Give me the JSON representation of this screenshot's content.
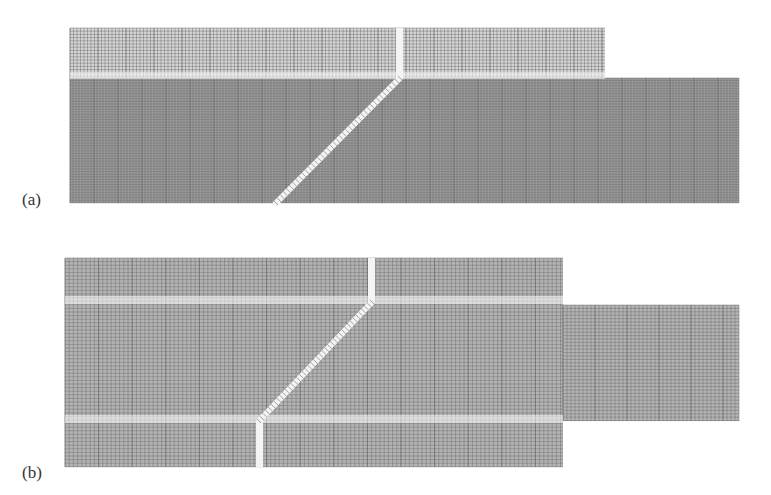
{
  "figure": {
    "panels": [
      {
        "id": "a",
        "label": "(a)",
        "label_pos": {
          "x": 22,
          "y": 190
        },
        "description": "Structured mesh with fine grid in lower region and inclined gap",
        "blocks": [
          {
            "name": "upper-block",
            "x": 70,
            "y": 28,
            "w": 535,
            "h": 50,
            "dx": 3.5,
            "dy": 3.2,
            "shade": "light"
          },
          {
            "name": "lower-main-block",
            "x": 70,
            "y": 78,
            "w": 669,
            "h": 125,
            "dx": 3.0,
            "dy": 2.6,
            "shade": "dark"
          }
        ],
        "vertical_gap": {
          "x": 396,
          "y1": 28,
          "y2": 78,
          "w": 7
        },
        "horizontal_band": {
          "y": 72,
          "h": 7
        },
        "diagonal_gap": {
          "x1": 400,
          "y1": 78,
          "x2": 276,
          "y2": 203,
          "w": 6
        }
      },
      {
        "id": "b",
        "label": "(b)",
        "label_pos": {
          "x": 22,
          "y": 463
        },
        "description": "Coarser structured mesh with bounded inclined gap and outlet channel",
        "blocks": [
          {
            "name": "main-block",
            "x": 65,
            "y": 258,
            "w": 498,
            "h": 209,
            "dx": 4.2,
            "dy": 3.6,
            "shade": "medium"
          },
          {
            "name": "outlet-block",
            "x": 563,
            "y": 305,
            "w": 176,
            "h": 116,
            "dx": 4.0,
            "dy": 3.4,
            "shade": "medium"
          }
        ],
        "vertical_gap_top": {
          "x": 368,
          "y1": 258,
          "y2": 302,
          "w": 7
        },
        "vertical_gap_bottom": {
          "x": 256,
          "y1": 421,
          "y2": 467,
          "w": 7
        },
        "horizontal_band_top": {
          "y": 296,
          "h": 8
        },
        "horizontal_band_bottom": {
          "y": 415,
          "h": 8
        },
        "diagonal_gap": {
          "x1": 372,
          "y1": 302,
          "x2": 259,
          "y2": 421,
          "w": 6
        }
      }
    ],
    "colors": {
      "line_light": "#9a9a9a",
      "line_dark": "#6a6a6a",
      "fill_light": "#d6d6d6",
      "fill_dark": "#9e9e9e",
      "fill_medium": "#b4b4b4",
      "gap": "#f4f4f4"
    }
  }
}
